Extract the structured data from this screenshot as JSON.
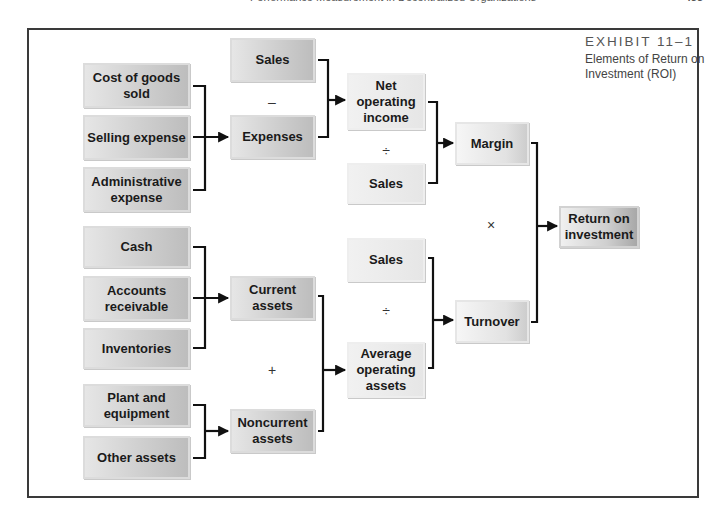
{
  "page_header": {
    "running_title": "Performance Measurement in Decentralized Organizations",
    "page_number": "453"
  },
  "exhibit": {
    "number": "EXHIBIT 11–1",
    "title": "Elements of Return on Investment (ROI)"
  },
  "nodes": {
    "cost_of_goods_sold": "Cost of goods sold",
    "selling_expense": "Selling expense",
    "administrative_expense": "Administrative expense",
    "cash": "Cash",
    "accounts_receivable": "Accounts receivable",
    "inventories": "Inventories",
    "plant_and_equipment": "Plant and equipment",
    "other_assets": "Other assets",
    "sales_top": "Sales",
    "expenses": "Expenses",
    "current_assets": "Current assets",
    "noncurrent_assets": "Noncurrent assets",
    "net_operating_income": "Net operating income",
    "sales_margin": "Sales",
    "sales_turnover": "Sales",
    "average_operating_assets": "Average operating assets",
    "margin": "Margin",
    "turnover": "Turnover",
    "return_on_investment": "Return on investment"
  },
  "operators": {
    "minus": "–",
    "divide_margin": "÷",
    "plus": "+",
    "divide_turnover": "÷",
    "multiply": "×"
  },
  "edges": [
    {
      "from": [
        "cost_of_goods_sold",
        "selling_expense",
        "administrative_expense"
      ],
      "to": "expenses"
    },
    {
      "from": [
        "sales_top",
        "expenses"
      ],
      "to": "net_operating_income",
      "operator": "minus"
    },
    {
      "from": [
        "net_operating_income",
        "sales_margin"
      ],
      "to": "margin",
      "operator": "divide_margin"
    },
    {
      "from": [
        "cash",
        "accounts_receivable",
        "inventories"
      ],
      "to": "current_assets"
    },
    {
      "from": [
        "plant_and_equipment",
        "other_assets"
      ],
      "to": "noncurrent_assets"
    },
    {
      "from": [
        "current_assets",
        "noncurrent_assets"
      ],
      "to": "average_operating_assets",
      "operator": "plus"
    },
    {
      "from": [
        "sales_turnover",
        "average_operating_assets"
      ],
      "to": "turnover",
      "operator": "divide_turnover"
    },
    {
      "from": [
        "margin",
        "turnover"
      ],
      "to": "return_on_investment",
      "operator": "multiply"
    }
  ]
}
